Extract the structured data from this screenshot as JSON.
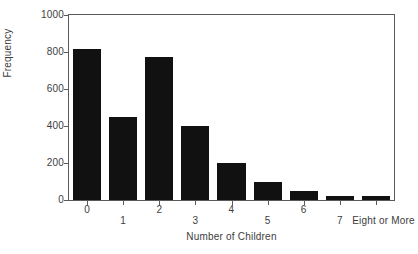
{
  "chart_data": {
    "type": "bar",
    "title": "",
    "subtitle": "",
    "xlabel": "Number of Children",
    "ylabel": "Frequency",
    "categories": [
      "0",
      "1",
      "2",
      "3",
      "4",
      "5",
      "6",
      "7",
      "Eight or More"
    ],
    "values": [
      815,
      450,
      775,
      400,
      200,
      100,
      50,
      20,
      20
    ],
    "ylim": [
      0,
      1000
    ],
    "yticks": [
      0,
      200,
      400,
      600,
      800,
      1000
    ],
    "ytick_labels": [
      "0",
      "200",
      "400",
      "600",
      "800",
      "1000"
    ],
    "grid": false,
    "legend": false,
    "legend_position": "none",
    "bar_color": "#111111",
    "axis_color": "#5a5a5a",
    "text_color": "#3d3d3d",
    "background_color": "#ffffff",
    "xtick_label_rows": [
      0,
      1,
      0,
      1,
      0,
      1,
      0,
      1,
      1
    ],
    "annotations": []
  }
}
